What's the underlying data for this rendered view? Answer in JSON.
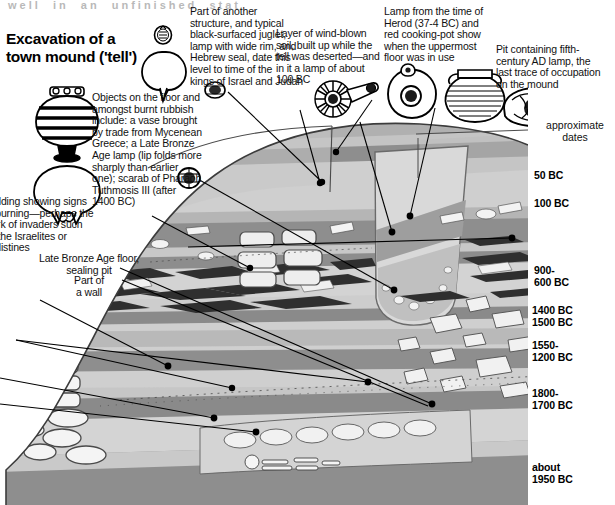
{
  "page": {
    "title": "Excavation of a\ntown mound ('tell')",
    "ghost_header": "well  in  an  unfinished  stat",
    "approximate_dates_label": "approximate\ndates"
  },
  "annotations": [
    {
      "id": "kings-israel-judah",
      "text": "Part of another\nstructure, and typical\nblack-surfaced juglet,\nlamp with wide rim, and\nHebrew seal, date this\nlevel to time of the\nkings of Israel and Judah"
    },
    {
      "id": "mycenean-objects",
      "text": "Objects on the floor and\namongst burnt rubbish\ninclude: a vase brought\nby trade from Mycenean\nGreece; a Late Bronze\nAge lamp (lip folds more\nsharply than earlier\none); scarab of Pharaoh\nTuthmosis III (after\n1400 BC)"
    },
    {
      "id": "wind-blown-soil",
      "text": "Layer of wind-blown\nsoil, built up while the\ntell was deserted—and\nin it a lamp of about\n100 BC"
    },
    {
      "id": "herod-lamp",
      "text": "Lamp from the time of\nHerod (37-4 BC) and\nred cooking-pot show\nwhen the uppermost\nfloor was in use"
    },
    {
      "id": "fifth-century-pit",
      "text": "Pit containing fifth-\ncentury AD lamp, the\nlast trace of occupation\non the mound"
    },
    {
      "id": "burnt-building",
      "text": "Building showing signs\nof burning—perhaps the\nwork of invaders such\nas the Israelites or\nPhilistines"
    },
    {
      "id": "lba-floor",
      "text": "Late Bronze Age floor,\nsealing pit"
    },
    {
      "id": "part-of-wall",
      "text": "Part of\na wall"
    }
  ],
  "dates": [
    {
      "id": "date-50bc",
      "text": "50 BC"
    },
    {
      "id": "date-100bc",
      "text": "100 BC"
    },
    {
      "id": "date-900-600",
      "text": "900-\n600 BC"
    },
    {
      "id": "date-1400bc",
      "text": "1400 BC"
    },
    {
      "id": "date-1500bc",
      "text": "1500 BC"
    },
    {
      "id": "date-1550-1200",
      "text": "1550-\n1200 BC"
    },
    {
      "id": "date-1800-1700",
      "text": "1800-\n1700 BC"
    },
    {
      "id": "date-about-1950",
      "text": "about\n1950 BC"
    }
  ],
  "artifacts": [
    {
      "id": "hebrew-seal-icon",
      "name": "hebrew-seal"
    },
    {
      "id": "juglet-icon",
      "name": "black-surfaced-juglet"
    },
    {
      "id": "scarab-small-icon",
      "name": "scarab-seal"
    },
    {
      "id": "mycenean-vase-icon",
      "name": "mycenean-vase"
    },
    {
      "id": "lba-lamp-icon",
      "name": "late-bronze-age-lamp"
    },
    {
      "id": "scarab-icon",
      "name": "scarab-of-tuthmosis-iii"
    },
    {
      "id": "lamp-100bc-icon",
      "name": "lamp-about-100-bc"
    },
    {
      "id": "herod-lamp-icon",
      "name": "herod-lamp"
    },
    {
      "id": "cooking-pot-icon",
      "name": "red-cooking-pot"
    },
    {
      "id": "ad-lamp-icon",
      "name": "fifth-century-ad-lamp"
    }
  ],
  "colors": {
    "stratum_light": "#d2d2d2",
    "stratum_mid": "#b6b6b6",
    "stratum_dark": "#8e8e8e",
    "stratum_darkest": "#6e6e6e",
    "stratum_pale": "#e4e4e4",
    "burnt_layer": "#3a3a3a",
    "outline": "#3c3c3c",
    "background": "#ffffff",
    "text": "#111111"
  }
}
